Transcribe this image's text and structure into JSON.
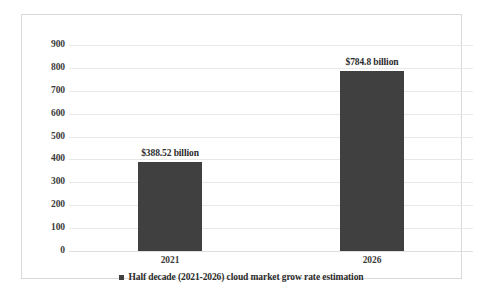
{
  "chart_data": {
    "type": "bar",
    "title": "",
    "subtitle": "",
    "xlabel": "",
    "ylabel": "",
    "categories": [
      "2021",
      "2026"
    ],
    "values": [
      388.52,
      784.8
    ],
    "data_labels": [
      "$388.52 billion",
      "$784.8 billion"
    ],
    "series": [
      {
        "name": "Half decade (2021-2026) cloud market grow rate estimation",
        "values": [
          388.52,
          784.8
        ],
        "color": "#404040"
      }
    ],
    "ylim": [
      0,
      900
    ],
    "ytick_step": 100,
    "yticks": [
      "900",
      "800",
      "700",
      "600",
      "500",
      "400",
      "300",
      "200",
      "100",
      "0"
    ],
    "ytick_values": [
      900,
      800,
      700,
      600,
      500,
      400,
      300,
      200,
      100,
      0
    ],
    "grid": true,
    "grid_axis": "y",
    "legend": {
      "position": "bottom",
      "entries": [
        {
          "label": "Half decade (2021-2026) cloud market grow rate estimation",
          "color": "#404040",
          "marker": "square"
        }
      ]
    },
    "colors": {
      "bar": "#404040",
      "gridline": "#e8e8e8",
      "border": "#d9d9d9",
      "text": "#2b2b2b",
      "background": "#ffffff"
    }
  }
}
